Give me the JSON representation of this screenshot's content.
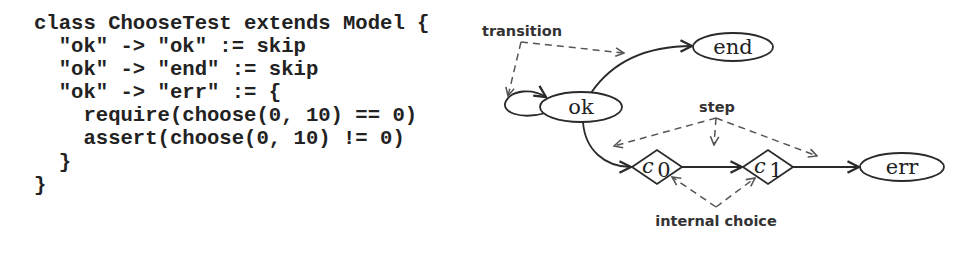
{
  "code": {
    "language": "scala",
    "lines": [
      "class ChooseTest extends Model {",
      "  \"ok\" -> \"ok\" := skip",
      "  \"ok\" -> \"end\" := skip",
      "  \"ok\" -> \"err\" := {",
      "    require(choose(0, 10) == 0)",
      "    assert(choose(0, 10) != 0)",
      "  }",
      "}"
    ]
  },
  "diagram": {
    "states": [
      {
        "id": "ok",
        "label": "ok",
        "shape": "ellipse"
      },
      {
        "id": "end",
        "label": "end",
        "shape": "ellipse"
      },
      {
        "id": "err",
        "label": "err",
        "shape": "ellipse"
      }
    ],
    "choice_nodes": [
      {
        "id": "c0",
        "label": "c",
        "subscript": "0",
        "shape": "diamond"
      },
      {
        "id": "c1",
        "label": "c",
        "subscript": "1",
        "shape": "diamond"
      }
    ],
    "edges": [
      {
        "from": "ok",
        "to": "ok",
        "kind": "self-loop"
      },
      {
        "from": "ok",
        "to": "end"
      },
      {
        "from": "ok",
        "to": "c0"
      },
      {
        "from": "c0",
        "to": "c1"
      },
      {
        "from": "c1",
        "to": "err"
      }
    ],
    "annotations": {
      "transition": "transition",
      "step": "step",
      "internal_choice": "internal choice"
    }
  }
}
